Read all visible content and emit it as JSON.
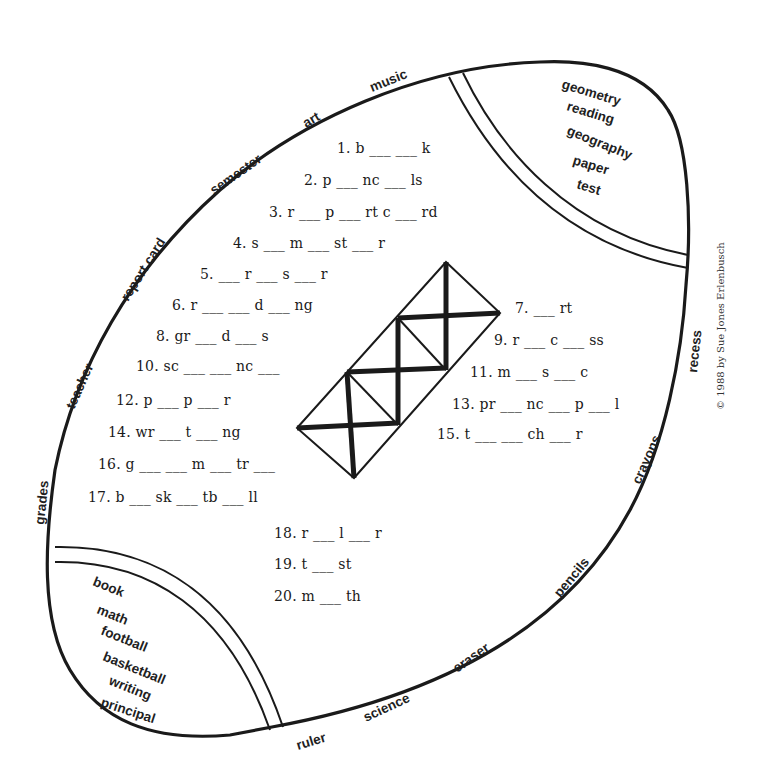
{
  "worksheet": {
    "title": "Football word puzzle",
    "copyright": "© 1988 by Sue Jones Erlenbusch",
    "ink_color": "#1a1a1a",
    "background": "#ffffff"
  },
  "outer_words": [
    {
      "text": "music"
    },
    {
      "text": "art"
    },
    {
      "text": "semester"
    },
    {
      "text": "report card"
    },
    {
      "text": "teacher"
    },
    {
      "text": "grades"
    },
    {
      "text": "recess"
    },
    {
      "text": "crayons"
    },
    {
      "text": "pencils"
    },
    {
      "text": "eraser"
    },
    {
      "text": "science"
    },
    {
      "text": "ruler"
    }
  ],
  "top_right_word_bank": [
    "geometry",
    "reading",
    "geography",
    "paper",
    "test"
  ],
  "bottom_left_word_bank": [
    "book",
    "math",
    "football",
    "basketball",
    "writing",
    "principal"
  ],
  "clues": [
    {
      "num": "1.",
      "text": "b ___ ___ k"
    },
    {
      "num": "2.",
      "text": "p ___ nc ___ ls"
    },
    {
      "num": "3.",
      "text": "r ___ p ___ rt c ___ rd"
    },
    {
      "num": "4.",
      "text": "s ___ m ___ st ___ r"
    },
    {
      "num": "5.",
      "text": "___ r ___ s ___ r"
    },
    {
      "num": "6.",
      "text": "r ___ ___ d ___ ng"
    },
    {
      "num": "7.",
      "text": " ___ rt"
    },
    {
      "num": "8.",
      "text": "gr ___ d ___ s"
    },
    {
      "num": "9.",
      "text": "r ___ c ___ ss"
    },
    {
      "num": "10.",
      "text": "sc ___ ___ nc ___"
    },
    {
      "num": "11.",
      "text": "m ___ s ___ c"
    },
    {
      "num": "12.",
      "text": "p ___ p ___ r"
    },
    {
      "num": "13.",
      "text": "pr ___ nc ___ p ___ l"
    },
    {
      "num": "14.",
      "text": "wr ___ t ___ ng"
    },
    {
      "num": "15.",
      "text": "t ___  ___ ch ___ r"
    },
    {
      "num": "16.",
      "text": "g ___ ___ m ___ tr ___"
    },
    {
      "num": "17.",
      "text": "b ___ sk ___ tb ___ ll"
    },
    {
      "num": "18.",
      "text": "r ___ l ___ r"
    },
    {
      "num": "19.",
      "text": "t ___ st"
    },
    {
      "num": "20.",
      "text": "m ___ th"
    }
  ],
  "grid": {
    "description": "diagonal 3-cell crossword lattice with X-crossed squares",
    "cells": 3
  }
}
